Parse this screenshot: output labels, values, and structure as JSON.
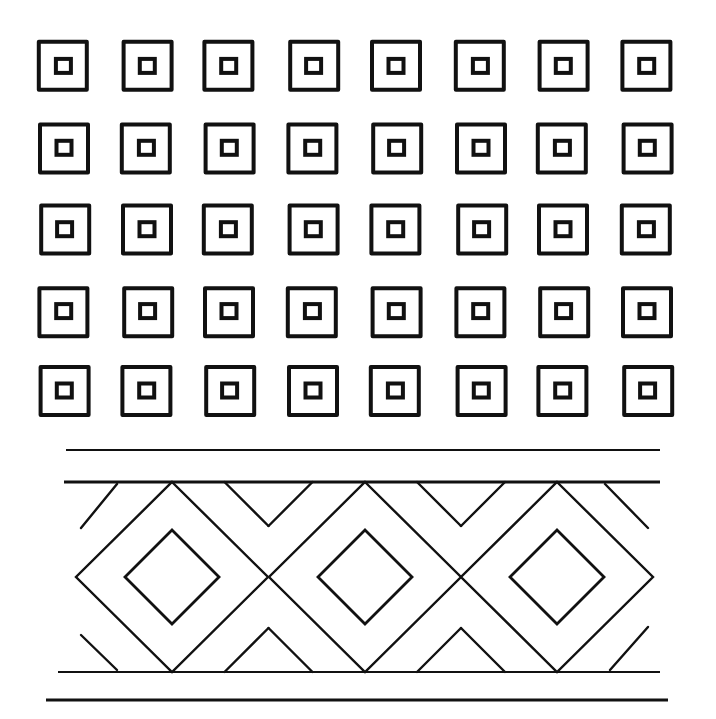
{
  "illustration": {
    "background": "#ffffff",
    "ink": "#111111",
    "square_grid": {
      "columns": 8,
      "rows": 5,
      "col_centers": [
        64,
        147,
        229,
        313,
        396,
        481,
        563,
        647
      ],
      "row_centers": [
        67,
        148,
        230,
        311,
        391
      ],
      "outer_size": 48,
      "inner_size": 15,
      "outer_stroke": 4,
      "inner_stroke": 4
    },
    "band": {
      "rule_lines": [
        {
          "x1": 66,
          "x2": 660,
          "y": 450
        },
        {
          "x1": 64,
          "x2": 660,
          "y": 482
        },
        {
          "x1": 58,
          "x2": 660,
          "y": 672
        },
        {
          "x1": 46,
          "x2": 668,
          "y": 700
        }
      ],
      "top": 482,
      "bottom": 672,
      "mid_y": 577,
      "diamond_centers_x": [
        172,
        365,
        557
      ],
      "outer_half_diagonal": 96,
      "inner_half_diagonal": 47,
      "stroke": 2.4
    }
  }
}
